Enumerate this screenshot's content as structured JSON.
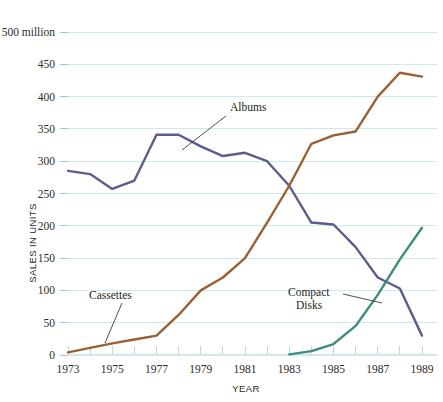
{
  "chart_data": {
    "type": "line",
    "title": "",
    "xlabel": "YEAR",
    "ylabel": "SALES IN UNITS",
    "x": [
      1973,
      1974,
      1975,
      1976,
      1977,
      1978,
      1979,
      1980,
      1981,
      1982,
      1983,
      1984,
      1985,
      1986,
      1987,
      1988,
      1989
    ],
    "xlim": [
      1973,
      1989
    ],
    "ylim": [
      0,
      500
    ],
    "grid": true,
    "legend_position": "none",
    "y_tick_values": [
      0,
      50,
      100,
      150,
      200,
      250,
      300,
      350,
      400,
      450,
      500
    ],
    "y_tick_labels": [
      "0",
      "50",
      "100",
      "150",
      "200",
      "250",
      "300",
      "350",
      "400",
      "450",
      "500 million"
    ],
    "x_tick_values": [
      1973,
      1974,
      1975,
      1976,
      1977,
      1978,
      1979,
      1980,
      1981,
      1982,
      1983,
      1984,
      1985,
      1986,
      1987,
      1988,
      1989
    ],
    "x_tick_labels": [
      "1973",
      "",
      "1975",
      "",
      "1977",
      "",
      "1979",
      "",
      "1981",
      "",
      "1983",
      "",
      "1985",
      "",
      "1987",
      "",
      "1989"
    ],
    "series": [
      {
        "name": "Albums",
        "color": "#5b5d8c",
        "values": [
          285,
          280,
          257,
          270,
          341,
          341,
          323,
          308,
          313,
          300,
          262,
          205,
          202,
          167,
          120,
          103,
          30
        ]
      },
      {
        "name": "Cassettes",
        "color": "#9a6034",
        "values": [
          4,
          11,
          18,
          24,
          30,
          62,
          100,
          120,
          150,
          205,
          262,
          327,
          340,
          346,
          400,
          437,
          431
        ]
      },
      {
        "name": "Compact Disks",
        "color": "#3f8b7c",
        "values": [
          null,
          null,
          null,
          null,
          null,
          null,
          null,
          null,
          null,
          null,
          1,
          6,
          17,
          45,
          93,
          148,
          197
        ]
      }
    ],
    "annotations": [
      {
        "text": "Albums",
        "series": "Albums",
        "label_x": 230,
        "label_y": 111,
        "leader_from_x": 226,
        "leader_from_y": 116,
        "leader_to_x": 182,
        "leader_to_y": 150
      },
      {
        "text": "Cassettes",
        "series": "Cassettes",
        "label_x": 89,
        "label_y": 299,
        "leader_from_x": 122,
        "leader_from_y": 303,
        "leader_to_x": 105,
        "leader_to_y": 343
      },
      {
        "text": "Compact",
        "text2": "Disks",
        "series": "Compact Disks",
        "label_x": 288,
        "label_y": 296,
        "label2_x": 296,
        "label2_y": 309,
        "leader_from_x": 343,
        "leader_from_y": 294,
        "leader_to_x": 382,
        "leader_to_y": 303
      }
    ],
    "colors": {
      "albums": "#5b5d8c",
      "cassettes": "#9a6034",
      "compact_disks": "#3f8b7c",
      "gridline": "#cfe8ea",
      "background": "#ffffff",
      "text": "#231f20"
    }
  }
}
